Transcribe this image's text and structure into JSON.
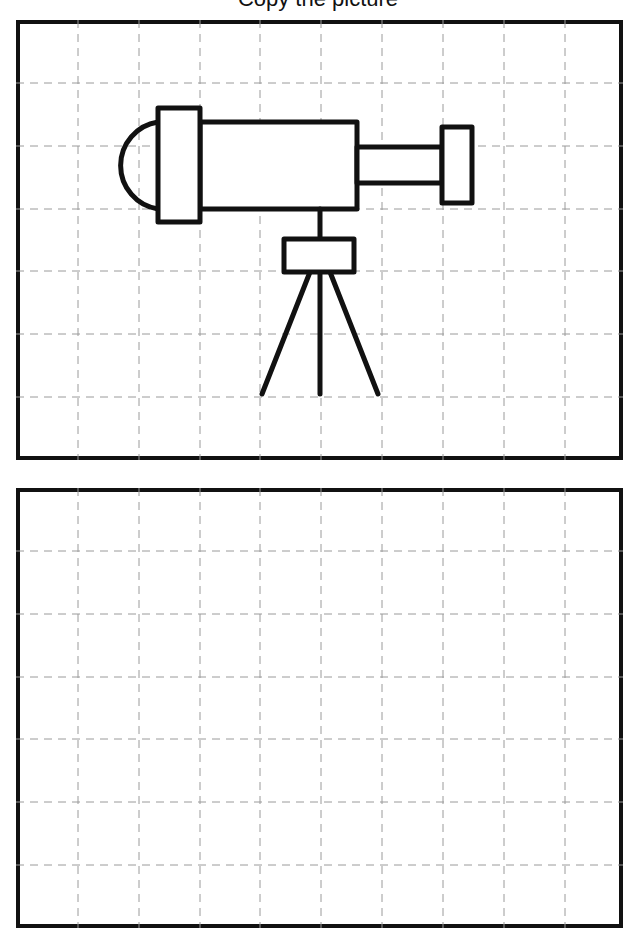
{
  "instruction": {
    "text": "Copy the picture"
  },
  "worksheet": {
    "grid": {
      "columns": 10,
      "rows": 7,
      "line_style": "dashed",
      "line_color": "#9a9a9a",
      "border_color": "#111111"
    },
    "panels": [
      {
        "name": "reference-panel",
        "content": "telescope-drawing"
      },
      {
        "name": "practice-panel",
        "content": "empty"
      }
    ],
    "drawing": {
      "subject": "telescope on tripod",
      "parts": [
        "dome-eyepiece",
        "eyepiece-collar",
        "main-tube",
        "small-tube",
        "lens-cap",
        "post",
        "mount-box",
        "tripod-legs"
      ]
    }
  }
}
